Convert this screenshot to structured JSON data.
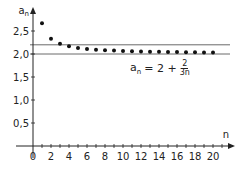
{
  "chart_data": {
    "type": "scatter",
    "title": "",
    "xlabel": "n",
    "ylabel": "a_n",
    "formula": {
      "lhs": "a",
      "sub": "n",
      "eq": "= 2 +",
      "num": "2",
      "den": "3n"
    },
    "x_ticks": [
      "0",
      "2",
      "4",
      "6",
      "8",
      "10",
      "12",
      "14",
      "16",
      "18",
      "20"
    ],
    "y_ticks": [
      "0,5",
      "1,0",
      "1,5",
      "2,0",
      "2,5"
    ],
    "xlim": [
      0,
      21
    ],
    "ylim": [
      0,
      2.7
    ],
    "reference_lines": [
      2.0,
      2.2
    ],
    "x": [
      1,
      2,
      3,
      4,
      5,
      6,
      7,
      8,
      9,
      10,
      11,
      12,
      13,
      14,
      15,
      16,
      17,
      18,
      19,
      20
    ],
    "values": [
      2.667,
      2.333,
      2.222,
      2.167,
      2.133,
      2.111,
      2.095,
      2.083,
      2.074,
      2.067,
      2.061,
      2.056,
      2.051,
      2.048,
      2.044,
      2.042,
      2.039,
      2.037,
      2.035,
      2.033
    ],
    "grid": false
  }
}
